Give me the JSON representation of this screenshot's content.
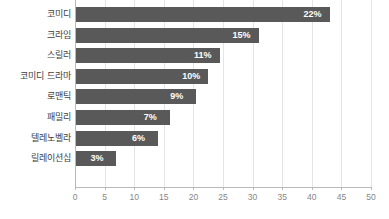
{
  "chart_data": {
    "type": "bar",
    "orientation": "horizontal",
    "title": "",
    "xlabel": "",
    "ylabel": "",
    "xlim": [
      0,
      50
    ],
    "xticks": [
      0,
      5,
      10,
      15,
      20,
      25,
      30,
      35,
      40,
      45,
      50
    ],
    "grid": true,
    "legend": null,
    "bar_color": "#595959",
    "label_color": "#ffffff",
    "axis_color": "#b9b9b9",
    "gridline_color": "#e4e4e4",
    "tick_label_color": "#868686",
    "category_label_color": "#404040",
    "categories": [
      "코미디",
      "크라임",
      "스릴러",
      "코미디 드라마",
      "로맨틱",
      "패밀리",
      "텔레노벨라",
      "릴레이션십"
    ],
    "values": [
      22,
      15,
      11,
      10,
      9,
      7,
      6,
      3
    ],
    "bar_extents": [
      43.0,
      31.0,
      24.5,
      22.5,
      20.5,
      16.0,
      14.0,
      7.0
    ],
    "data_labels": [
      "22%",
      "15%",
      "11%",
      "10%",
      "9%",
      "7%",
      "6%",
      "3%"
    ]
  }
}
